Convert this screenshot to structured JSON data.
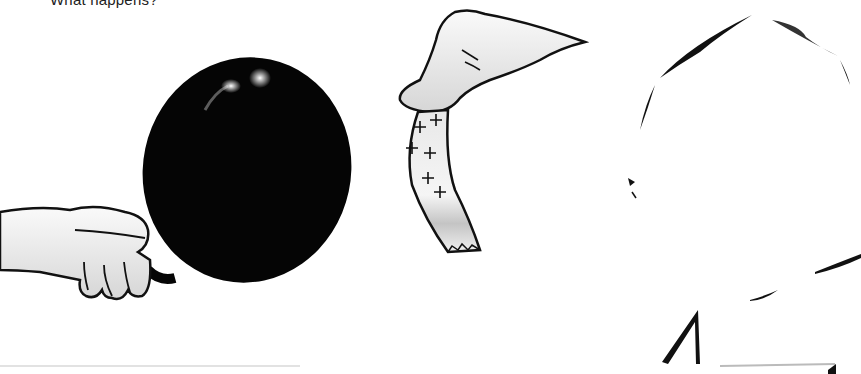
{
  "caption": {
    "text": "What happens?"
  },
  "illustration": {
    "elements": [
      {
        "name": "left-hand",
        "holds": "balloon"
      },
      {
        "name": "balloon",
        "color": "#050505"
      },
      {
        "name": "right-hand",
        "holds": "paper-strip"
      },
      {
        "name": "paper-strip",
        "charge_marks": [
          "+",
          "+",
          "+",
          "+",
          "+",
          "+"
        ]
      },
      {
        "name": "face-outline"
      }
    ]
  },
  "colors": {
    "background": "#ffffff",
    "balloon": "#050505",
    "outline": "#111111",
    "skin": "#f2f2f2",
    "shade": "#bdbdbd"
  }
}
